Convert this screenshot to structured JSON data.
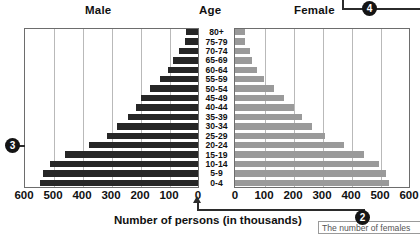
{
  "header": {
    "male_label": "Male",
    "age_label": "Age",
    "female_label": "Female"
  },
  "axis": {
    "title": "Number of persons (in thousands)",
    "left_ticks": [
      "600",
      "500",
      "400",
      "300",
      "200",
      "100",
      "0"
    ],
    "right_ticks": [
      "0",
      "100",
      "200",
      "300",
      "400",
      "500",
      "600"
    ]
  },
  "callouts": [
    {
      "id": "callout-2",
      "number": "2",
      "text": "The number of females"
    },
    {
      "id": "callout-3",
      "number": "3",
      "text": ""
    },
    {
      "id": "callout-4",
      "number": "4",
      "text": ""
    }
  ],
  "colors": {
    "male_bar": "#262626",
    "female_bar": "#9a9a9a",
    "frame": "#6d6d6d",
    "gridline": "#b9b9b9",
    "badge": "#141414"
  },
  "chart_data": {
    "type": "bar",
    "subtype": "population-pyramid",
    "title": "",
    "xlabel": "Number of persons (in thousands)",
    "ylabel": "Age",
    "xlim": [
      0,
      600
    ],
    "grid": true,
    "tick_step": 100,
    "legend": [
      "Male",
      "Female"
    ],
    "categories": [
      "80+",
      "75-79",
      "70-74",
      "65-69",
      "60-64",
      "55-59",
      "50-54",
      "45-49",
      "40-44",
      "35-39",
      "30-34",
      "25-29",
      "20-24",
      "15-19",
      "10-14",
      "5-9",
      "0-4"
    ],
    "series": [
      {
        "name": "Male",
        "values": [
          40,
          45,
          65,
          85,
          105,
          130,
          165,
          195,
          215,
          240,
          280,
          315,
          375,
          460,
          510,
          535,
          545
        ]
      },
      {
        "name": "Female",
        "values": [
          35,
          35,
          50,
          60,
          75,
          100,
          135,
          170,
          205,
          230,
          265,
          310,
          375,
          445,
          495,
          520,
          530
        ]
      }
    ]
  }
}
